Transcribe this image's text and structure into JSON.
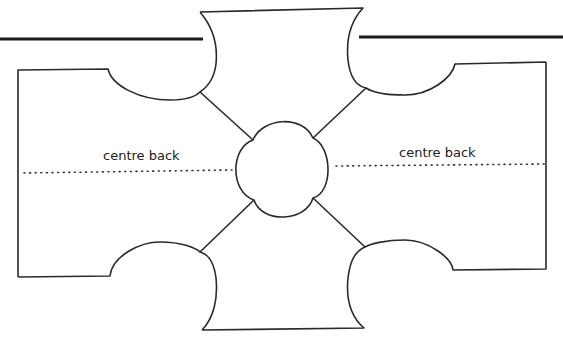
{
  "diagram": {
    "type": "sewing-pattern",
    "labels": {
      "left_centre_back": "centre back",
      "right_centre_back": "centre back"
    },
    "colors": {
      "stroke": "#2a2a2a",
      "background": "#ffffff"
    },
    "shapes": [
      "top-fold-line-left",
      "top-fold-line-right",
      "left-back-panel",
      "right-back-panel",
      "top-sleeve-panel",
      "bottom-sleeve-panel",
      "central-quatrefoil",
      "diagonal-seam-lines"
    ]
  }
}
